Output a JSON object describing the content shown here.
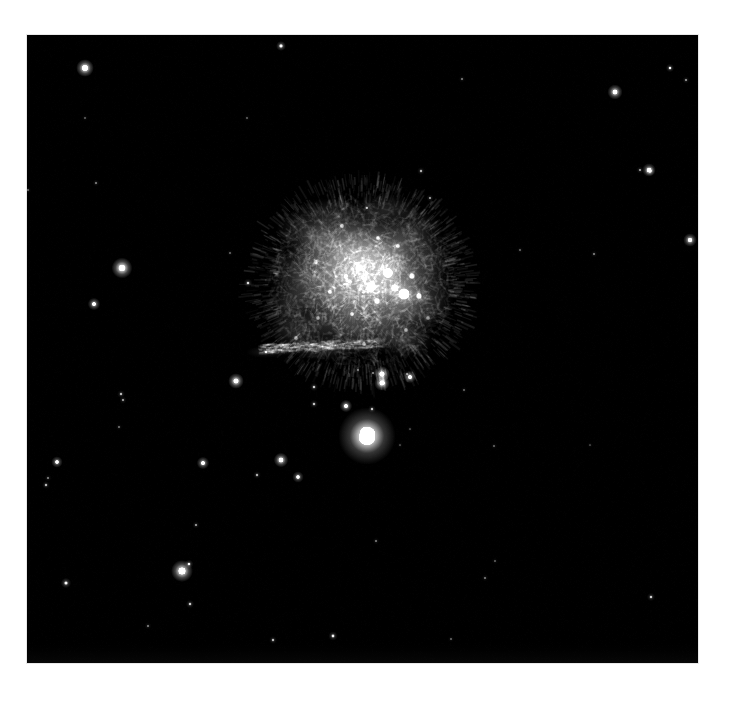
{
  "page": {
    "title": "Supernova remnant nebula field",
    "background_color": "#ffffff",
    "width": 731,
    "height": 701
  },
  "image_frame": {
    "name": "astronomical-image",
    "x": 27,
    "y": 35,
    "width": 671,
    "height": 628,
    "sky_color": "#000000",
    "border_color": "#e8e8e8"
  },
  "scene": {
    "description": "Grayscale astronomical photograph of a diffuse knotted nebula (supernova remnant) on a black star field",
    "color_mode": "grayscale",
    "nebula_color": "#d8d8d8",
    "star_color": "#ffffff"
  },
  "nebula": {
    "name": "main-nebula",
    "center_x": 362,
    "center_y": 283,
    "radius_x": 88,
    "radius_y": 82,
    "peak_brightness": 0.95,
    "blobs": [
      {
        "x": 362,
        "y": 272,
        "rx": 74,
        "ry": 66,
        "a": 0.3
      },
      {
        "x": 356,
        "y": 262,
        "rx": 62,
        "ry": 56,
        "a": 0.3
      },
      {
        "x": 372,
        "y": 286,
        "rx": 56,
        "ry": 52,
        "a": 0.32
      },
      {
        "x": 340,
        "y": 252,
        "rx": 48,
        "ry": 40,
        "a": 0.26
      },
      {
        "x": 394,
        "y": 262,
        "rx": 44,
        "ry": 44,
        "a": 0.28
      },
      {
        "x": 330,
        "y": 300,
        "rx": 48,
        "ry": 36,
        "a": 0.26
      },
      {
        "x": 398,
        "y": 312,
        "rx": 40,
        "ry": 36,
        "a": 0.24
      },
      {
        "x": 310,
        "y": 232,
        "rx": 34,
        "ry": 26,
        "a": 0.2
      },
      {
        "x": 414,
        "y": 232,
        "rx": 28,
        "ry": 24,
        "a": 0.18
      },
      {
        "x": 424,
        "y": 296,
        "rx": 30,
        "ry": 34,
        "a": 0.22
      },
      {
        "x": 300,
        "y": 276,
        "rx": 30,
        "ry": 32,
        "a": 0.22
      },
      {
        "x": 356,
        "y": 330,
        "rx": 46,
        "ry": 26,
        "a": 0.24
      },
      {
        "x": 300,
        "y": 330,
        "rx": 32,
        "ry": 18,
        "a": 0.2
      },
      {
        "x": 386,
        "y": 210,
        "rx": 34,
        "ry": 16,
        "a": 0.16
      },
      {
        "x": 332,
        "y": 212,
        "rx": 30,
        "ry": 14,
        "a": 0.15
      },
      {
        "x": 430,
        "y": 260,
        "rx": 20,
        "ry": 26,
        "a": 0.16
      },
      {
        "x": 288,
        "y": 306,
        "rx": 20,
        "ry": 22,
        "a": 0.16
      },
      {
        "x": 404,
        "y": 340,
        "rx": 30,
        "ry": 18,
        "a": 0.18
      },
      {
        "x": 322,
        "y": 348,
        "rx": 36,
        "ry": 12,
        "a": 0.18
      },
      {
        "x": 282,
        "y": 348,
        "rx": 26,
        "ry": 8,
        "a": 0.16
      },
      {
        "x": 266,
        "y": 352,
        "rx": 20,
        "ry": 6,
        "a": 0.12
      }
    ],
    "knots": [
      {
        "x": 388,
        "y": 273,
        "r": 7,
        "a": 0.9
      },
      {
        "x": 404,
        "y": 294,
        "r": 8,
        "a": 0.95
      },
      {
        "x": 371,
        "y": 287,
        "r": 6,
        "a": 0.85
      },
      {
        "x": 395,
        "y": 288,
        "r": 5,
        "a": 0.8
      },
      {
        "x": 412,
        "y": 276,
        "r": 4,
        "a": 0.75
      },
      {
        "x": 377,
        "y": 301,
        "r": 4,
        "a": 0.7
      },
      {
        "x": 359,
        "y": 268,
        "r": 4,
        "a": 0.7
      },
      {
        "x": 346,
        "y": 276,
        "r": 3,
        "a": 0.62
      },
      {
        "x": 398,
        "y": 246,
        "r": 3,
        "a": 0.66
      },
      {
        "x": 378,
        "y": 238,
        "r": 3,
        "a": 0.6
      },
      {
        "x": 419,
        "y": 296,
        "r": 4,
        "a": 0.72
      },
      {
        "x": 352,
        "y": 314,
        "r": 3,
        "a": 0.6
      },
      {
        "x": 330,
        "y": 292,
        "r": 3,
        "a": 0.58
      },
      {
        "x": 316,
        "y": 262,
        "r": 3,
        "a": 0.54
      },
      {
        "x": 406,
        "y": 330,
        "r": 3,
        "a": 0.58
      },
      {
        "x": 364,
        "y": 344,
        "r": 3,
        "a": 0.58
      },
      {
        "x": 296,
        "y": 338,
        "r": 3,
        "a": 0.56
      },
      {
        "x": 342,
        "y": 226,
        "r": 3,
        "a": 0.55
      },
      {
        "x": 428,
        "y": 318,
        "r": 3,
        "a": 0.52
      },
      {
        "x": 318,
        "y": 318,
        "r": 3,
        "a": 0.52
      }
    ]
  },
  "compact_object": {
    "name": "bright-compact-nebula",
    "x": 367,
    "y": 436,
    "radius": 11,
    "brightness": 1.0
  },
  "stars": [
    {
      "x": 85,
      "y": 68,
      "r": 3.4,
      "b": 1.0
    },
    {
      "x": 281,
      "y": 46,
      "r": 1.9,
      "b": 0.72
    },
    {
      "x": 615,
      "y": 92,
      "r": 2.9,
      "b": 0.92
    },
    {
      "x": 670,
      "y": 68,
      "r": 1.6,
      "b": 0.58
    },
    {
      "x": 650,
      "y": 171,
      "r": 1.9,
      "b": 0.62
    },
    {
      "x": 122,
      "y": 268,
      "r": 4.0,
      "b": 1.0
    },
    {
      "x": 94,
      "y": 304,
      "r": 2.4,
      "b": 0.82
    },
    {
      "x": 96,
      "y": 183,
      "r": 1.3,
      "b": 0.34
    },
    {
      "x": 28,
      "y": 190,
      "r": 1.2,
      "b": 0.3
    },
    {
      "x": 640,
      "y": 170,
      "r": 1.4,
      "b": 0.4
    },
    {
      "x": 649,
      "y": 170,
      "r": 2.6,
      "b": 0.86
    },
    {
      "x": 690,
      "y": 240,
      "r": 2.6,
      "b": 0.88
    },
    {
      "x": 594,
      "y": 254,
      "r": 1.3,
      "b": 0.34
    },
    {
      "x": 421,
      "y": 171,
      "r": 1.5,
      "b": 0.42
    },
    {
      "x": 430,
      "y": 198,
      "r": 1.4,
      "b": 0.4
    },
    {
      "x": 248,
      "y": 283,
      "r": 1.7,
      "b": 0.5
    },
    {
      "x": 266,
      "y": 352,
      "r": 1.5,
      "b": 0.44
    },
    {
      "x": 236,
      "y": 381,
      "r": 3.0,
      "b": 0.95
    },
    {
      "x": 314,
      "y": 387,
      "r": 1.6,
      "b": 0.48
    },
    {
      "x": 382,
      "y": 374,
      "r": 3.0,
      "b": 0.96
    },
    {
      "x": 382,
      "y": 383,
      "r": 3.0,
      "b": 0.96
    },
    {
      "x": 410,
      "y": 377,
      "r": 2.4,
      "b": 0.84
    },
    {
      "x": 372,
      "y": 409,
      "r": 1.5,
      "b": 0.46
    },
    {
      "x": 346,
      "y": 406,
      "r": 2.4,
      "b": 0.84
    },
    {
      "x": 314,
      "y": 404,
      "r": 1.6,
      "b": 0.46
    },
    {
      "x": 121,
      "y": 394,
      "r": 1.5,
      "b": 0.44
    },
    {
      "x": 123,
      "y": 400,
      "r": 1.4,
      "b": 0.4
    },
    {
      "x": 119,
      "y": 427,
      "r": 1.2,
      "b": 0.32
    },
    {
      "x": 57,
      "y": 462,
      "r": 2.2,
      "b": 0.78
    },
    {
      "x": 203,
      "y": 463,
      "r": 2.4,
      "b": 0.84
    },
    {
      "x": 281,
      "y": 460,
      "r": 2.8,
      "b": 0.92
    },
    {
      "x": 257,
      "y": 475,
      "r": 1.5,
      "b": 0.42
    },
    {
      "x": 298,
      "y": 477,
      "r": 2.2,
      "b": 0.76
    },
    {
      "x": 48,
      "y": 478,
      "r": 1.3,
      "b": 0.34
    },
    {
      "x": 196,
      "y": 525,
      "r": 1.4,
      "b": 0.4
    },
    {
      "x": 46,
      "y": 485,
      "r": 1.5,
      "b": 0.44
    },
    {
      "x": 182,
      "y": 571,
      "r": 4.2,
      "b": 1.0
    },
    {
      "x": 189,
      "y": 564,
      "r": 1.7,
      "b": 0.56
    },
    {
      "x": 66,
      "y": 583,
      "r": 2.0,
      "b": 0.62
    },
    {
      "x": 190,
      "y": 604,
      "r": 1.6,
      "b": 0.48
    },
    {
      "x": 148,
      "y": 626,
      "r": 1.3,
      "b": 0.34
    },
    {
      "x": 333,
      "y": 636,
      "r": 1.8,
      "b": 0.56
    },
    {
      "x": 273,
      "y": 640,
      "r": 1.5,
      "b": 0.44
    },
    {
      "x": 373,
      "y": 373,
      "r": 1.3,
      "b": 0.36
    },
    {
      "x": 407,
      "y": 374,
      "r": 1.3,
      "b": 0.34
    },
    {
      "x": 400,
      "y": 445,
      "r": 1.1,
      "b": 0.26
    },
    {
      "x": 410,
      "y": 429,
      "r": 1.1,
      "b": 0.26
    },
    {
      "x": 494,
      "y": 446,
      "r": 1.2,
      "b": 0.28
    },
    {
      "x": 495,
      "y": 561,
      "r": 1.2,
      "b": 0.26
    },
    {
      "x": 485,
      "y": 578,
      "r": 1.3,
      "b": 0.32
    },
    {
      "x": 651,
      "y": 597,
      "r": 1.6,
      "b": 0.48
    },
    {
      "x": 451,
      "y": 639,
      "r": 1.2,
      "b": 0.28
    },
    {
      "x": 367,
      "y": 208,
      "r": 1.4,
      "b": 0.38
    },
    {
      "x": 462,
      "y": 79,
      "r": 1.3,
      "b": 0.32
    },
    {
      "x": 686,
      "y": 80,
      "r": 1.4,
      "b": 0.38
    },
    {
      "x": 520,
      "y": 250,
      "r": 1.2,
      "b": 0.28
    },
    {
      "x": 230,
      "y": 253,
      "r": 1.2,
      "b": 0.28
    },
    {
      "x": 85,
      "y": 118,
      "r": 1.2,
      "b": 0.26
    },
    {
      "x": 247,
      "y": 118,
      "r": 1.2,
      "b": 0.26
    },
    {
      "x": 358,
      "y": 370,
      "r": 1.2,
      "b": 0.3
    },
    {
      "x": 464,
      "y": 390,
      "r": 1.2,
      "b": 0.28
    },
    {
      "x": 590,
      "y": 445,
      "r": 1.1,
      "b": 0.24
    },
    {
      "x": 376,
      "y": 541,
      "r": 1.3,
      "b": 0.32
    }
  ]
}
